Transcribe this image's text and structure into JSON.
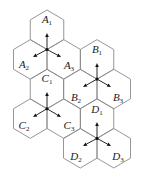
{
  "diagram": {
    "title": "",
    "geometry": {
      "R": 19.75,
      "half_width": 16.75
    },
    "colors": {
      "hex_stroke": "#8a8a8a",
      "arrow": "#111111",
      "label": "#222222"
    },
    "clusters": [
      {
        "name": "A",
        "center": [
          47,
          49.5
        ],
        "cells": [
          {
            "letter": "A",
            "sub": "1",
            "hex_center": [
              47,
              29.75
            ],
            "label_pos": [
              47,
              20
            ],
            "arrow_to": [
              47,
              33
            ]
          },
          {
            "letter": "A",
            "sub": "2",
            "hex_center": [
              30.25,
              59.4
            ],
            "label_pos": [
              24,
              65
            ],
            "arrow_to": [
              33,
              57
            ]
          },
          {
            "letter": "A",
            "sub": "3",
            "hex_center": [
              63.75,
              59.4
            ],
            "label_pos": [
              69,
              66
            ],
            "arrow_to": [
              61,
              57
            ]
          }
        ]
      },
      {
        "name": "B",
        "center": [
          97,
          79.1
        ],
        "cells": [
          {
            "letter": "B",
            "sub": "1",
            "hex_center": [
              97,
              59.4
            ],
            "label_pos": [
              97,
              50
            ],
            "arrow_to": [
              97,
              63
            ]
          },
          {
            "letter": "B",
            "sub": "2",
            "hex_center": [
              80.25,
              89
            ],
            "label_pos": [
              76,
              98
            ],
            "arrow_to": [
              83,
              87
            ]
          },
          {
            "letter": "B",
            "sub": "3",
            "hex_center": [
              113.75,
              89
            ],
            "label_pos": [
              118,
              98
            ],
            "arrow_to": [
              111,
              87
            ]
          }
        ]
      },
      {
        "name": "C",
        "center": [
          47,
          108.75
        ],
        "cells": [
          {
            "letter": "C",
            "sub": "1",
            "hex_center": [
              47,
              89
            ],
            "label_pos": [
              47,
              79
            ],
            "arrow_to": [
              47,
              92
            ]
          },
          {
            "letter": "C",
            "sub": "2",
            "hex_center": [
              30.25,
              118.6
            ],
            "label_pos": [
              24,
              126
            ],
            "arrow_to": [
              33,
              117
            ]
          },
          {
            "letter": "C",
            "sub": "3",
            "hex_center": [
              63.75,
              118.6
            ],
            "label_pos": [
              69,
              126
            ],
            "arrow_to": [
              61,
              117
            ]
          }
        ]
      },
      {
        "name": "D",
        "center": [
          97,
          138.4
        ],
        "cells": [
          {
            "letter": "D",
            "sub": "1",
            "hex_center": [
              97,
              118.6
            ],
            "label_pos": [
              97,
              110
            ],
            "arrow_to": [
              97,
              122
            ]
          },
          {
            "letter": "D",
            "sub": "2",
            "hex_center": [
              80.25,
              148.25
            ],
            "label_pos": [
              76,
              157
            ],
            "arrow_to": [
              83,
              146
            ]
          },
          {
            "letter": "D",
            "sub": "3",
            "hex_center": [
              113.75,
              148.25
            ],
            "label_pos": [
              118,
              157
            ],
            "arrow_to": [
              111,
              146
            ]
          }
        ]
      }
    ]
  }
}
